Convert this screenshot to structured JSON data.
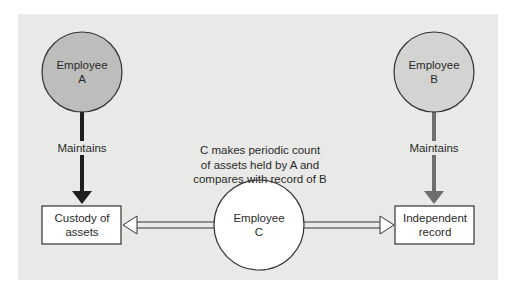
{
  "nodes": {
    "employee_a": {
      "line1": "Employee",
      "line2": "A",
      "fill": "#bdbdbb"
    },
    "employee_b": {
      "line1": "Employee",
      "line2": "B",
      "fill": "#d3d3d1"
    },
    "employee_c": {
      "line1": "Employee",
      "line2": "C",
      "fill": "#ffffff"
    },
    "custody": {
      "line1": "Custody of",
      "line2": "assets"
    },
    "record": {
      "line1": "Independent",
      "line2": "record"
    }
  },
  "edges": {
    "a_to_custody": {
      "label": "Maintains",
      "color": "#1e1e1e"
    },
    "b_to_record": {
      "label": "Maintains",
      "color": "#6e6e6e"
    }
  },
  "description": {
    "line1": "C makes periodic count",
    "line2": "of assets held by A and",
    "line3": "compares with record of B"
  },
  "colors": {
    "background": "#e9e9e7",
    "stroke": "#333333"
  }
}
